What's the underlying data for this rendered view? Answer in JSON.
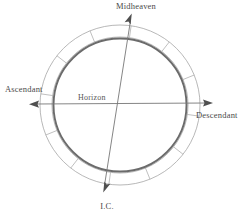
{
  "figure": {
    "background_color": "#ffffff",
    "width": 243,
    "height": 217
  },
  "chart_data": {
    "type": "diagram",
    "title": "",
    "subtitle": "",
    "diagram_kind": "astrological-chart-wheel",
    "center": [
      120,
      105
    ],
    "radii": {
      "outer_ring": 80,
      "inner_ring": 68,
      "main_circle": 66.5
    },
    "ring": {
      "segment_count": 12,
      "segment_span_degrees": 30,
      "rotation_offset_degrees": 8,
      "stroke_color": "#9a9a9a",
      "fill_color": "#ffffff"
    },
    "main_circle": {
      "stroke_color": "#6b6b6b",
      "stroke_width": 1.9
    },
    "axes": [
      {
        "name": "horizon",
        "label_start": "Ascendant",
        "label_end": "Descendant",
        "from": [
          30,
          104
        ],
        "to": [
          212,
          103
        ],
        "tilt_degrees": 0,
        "arrow_start": true,
        "arrow_end": true,
        "color": "#777777"
      },
      {
        "name": "meridian",
        "label_start": "Midheaven",
        "label_end": "I.C.",
        "from": [
          132,
          14
        ],
        "to": [
          103,
          192
        ],
        "tilt_degrees": 8,
        "arrow_start": true,
        "arrow_end": true,
        "color": "#777777"
      }
    ],
    "annotations": [
      {
        "text": "Midheaven",
        "x": 136,
        "y": 9,
        "anchor": "middle"
      },
      {
        "text": "Ascendant",
        "x": 5,
        "y": 92,
        "anchor": "start"
      },
      {
        "text": "Descendant",
        "x": 196,
        "y": 118,
        "anchor": "start"
      },
      {
        "text": "I.C.",
        "x": 107,
        "y": 209,
        "anchor": "middle"
      },
      {
        "text": "Horizon",
        "x": 78,
        "y": 100,
        "anchor": "start"
      }
    ]
  },
  "labels": {
    "midheaven": "Midheaven",
    "ascendant": "Ascendant",
    "descendant": "Descendant",
    "ic": "I.C.",
    "horizon": "Horizon"
  },
  "colors": {
    "background": "#ffffff",
    "ring_stroke": "#9a9a9a",
    "circle_stroke": "#6b6b6b",
    "axis_stroke": "#777777",
    "arrow_fill": "#4f4f4f",
    "text": "#4a4a4a"
  }
}
